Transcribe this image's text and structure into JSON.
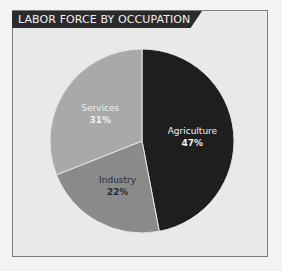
{
  "chart_data": {
    "type": "pie",
    "title": "LABOR FORCE BY OCCUPATION",
    "categories": [
      "Agriculture",
      "Industry",
      "Services"
    ],
    "values": [
      47,
      22,
      31
    ],
    "value_labels": [
      "47%",
      "22%",
      "31%"
    ],
    "colors": [
      "#1e1e1e",
      "#8a8a8a",
      "#a9a9a9"
    ],
    "label_colors": [
      "#f0f0f0",
      "#2a2a2a",
      "#f0f0f0"
    ],
    "legend": "none (labels inside slices)"
  },
  "title": "LABOR FORCE BY OCCUPATION"
}
